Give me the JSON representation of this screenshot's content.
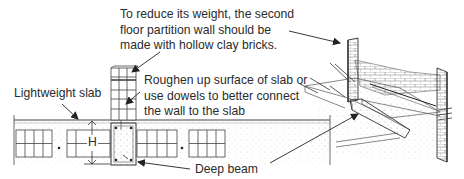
{
  "diagram": {
    "type": "construction-detail",
    "left_view": "cross-section of lightweight slab with deep beam",
    "right_view": "isometric view of slab, deep beam and partition walls"
  },
  "labels": {
    "partition_note": {
      "lines": [
        "To reduce its weight, the second",
        "floor partition wall should be",
        "made with hollow clay bricks."
      ]
    },
    "dowel_note": {
      "lines": [
        "Roughen up surface of slab or",
        "use dowels to better connect",
        "the wall to the slab"
      ]
    },
    "lightweight_slab": "Lightweight slab",
    "height_marker": "H",
    "deep_beam": "Deep beam"
  },
  "colors": {
    "line": "#333333",
    "text": "#2b2b2b",
    "background": "#ffffff"
  }
}
